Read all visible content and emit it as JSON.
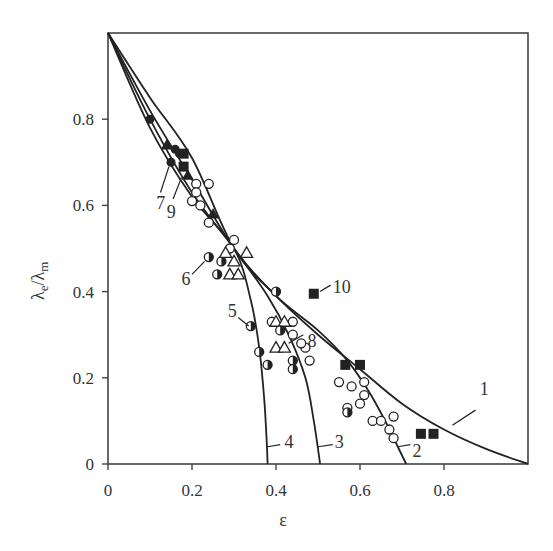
{
  "chart_data": {
    "type": "scatter",
    "title": "",
    "xlabel": "ε",
    "ylabel": "λe/λm",
    "ylabel_main": "λ",
    "ylabel_sub_e": "e",
    "ylabel_slash": "/λ",
    "ylabel_sub_m": "m",
    "xlim": [
      0,
      1.0
    ],
    "ylim": [
      0,
      1.0
    ],
    "xticks": [
      0,
      0.2,
      0.4,
      0.6,
      0.8
    ],
    "xtick_labels": [
      "0",
      "0.2",
      "0.4",
      "0.6",
      "0.8"
    ],
    "yticks": [
      0,
      0.2,
      0.4,
      0.6,
      0.8
    ],
    "ytick_labels": [
      "0",
      "0.2",
      "0.4",
      "0.6",
      "0.8"
    ],
    "grid": false,
    "legend": "none (curves and point sets numbered inline 1–10)",
    "curves": [
      {
        "name": "1",
        "points": [
          [
            0,
            1.0
          ],
          [
            0.1,
            0.85
          ],
          [
            0.2,
            0.71
          ],
          [
            0.3,
            0.5
          ],
          [
            0.4,
            0.39
          ],
          [
            0.5,
            0.3
          ],
          [
            0.6,
            0.22
          ],
          [
            0.7,
            0.14
          ],
          [
            0.8,
            0.08
          ],
          [
            0.9,
            0.035
          ],
          [
            1.0,
            0.0
          ]
        ]
      },
      {
        "name": "2",
        "points": [
          [
            0,
            1.0
          ],
          [
            0.1,
            0.82
          ],
          [
            0.2,
            0.66
          ],
          [
            0.3,
            0.5
          ],
          [
            0.4,
            0.39
          ],
          [
            0.5,
            0.31
          ],
          [
            0.57,
            0.24
          ],
          [
            0.62,
            0.17
          ],
          [
            0.66,
            0.1
          ],
          [
            0.69,
            0.04
          ],
          [
            0.71,
            0.0
          ]
        ]
      },
      {
        "name": "3",
        "points": [
          [
            0,
            1.0
          ],
          [
            0.1,
            0.8
          ],
          [
            0.2,
            0.63
          ],
          [
            0.3,
            0.5
          ],
          [
            0.38,
            0.39
          ],
          [
            0.43,
            0.3
          ],
          [
            0.47,
            0.2
          ],
          [
            0.49,
            0.1
          ],
          [
            0.505,
            0.0
          ]
        ]
      },
      {
        "name": "4",
        "points": [
          [
            0,
            1.0
          ],
          [
            0.1,
            0.78
          ],
          [
            0.2,
            0.62
          ],
          [
            0.3,
            0.5
          ],
          [
            0.34,
            0.38
          ],
          [
            0.36,
            0.27
          ],
          [
            0.372,
            0.15
          ],
          [
            0.378,
            0.05
          ],
          [
            0.38,
            0.0
          ]
        ]
      }
    ],
    "series": [
      {
        "name": "7",
        "marker": "filled-circle",
        "values": [
          [
            0.15,
            0.7
          ],
          [
            0.16,
            0.73
          ],
          [
            0.1,
            0.8
          ],
          [
            0.17,
            0.72
          ]
        ]
      },
      {
        "name": "9",
        "marker": "filled-triangle",
        "values": [
          [
            0.19,
            0.67
          ],
          [
            0.14,
            0.74
          ],
          [
            0.25,
            0.58
          ]
        ]
      },
      {
        "name": "open-circles",
        "marker": "open-circle",
        "values": [
          [
            0.21,
            0.65
          ],
          [
            0.24,
            0.65
          ],
          [
            0.21,
            0.63
          ],
          [
            0.2,
            0.61
          ],
          [
            0.22,
            0.6
          ],
          [
            0.24,
            0.56
          ],
          [
            0.3,
            0.52
          ],
          [
            0.29,
            0.5
          ],
          [
            0.39,
            0.33
          ],
          [
            0.44,
            0.33
          ],
          [
            0.44,
            0.3
          ],
          [
            0.47,
            0.27
          ],
          [
            0.48,
            0.24
          ],
          [
            0.55,
            0.19
          ],
          [
            0.58,
            0.18
          ],
          [
            0.61,
            0.16
          ],
          [
            0.57,
            0.13
          ],
          [
            0.6,
            0.14
          ],
          [
            0.63,
            0.1
          ],
          [
            0.65,
            0.1
          ],
          [
            0.67,
            0.08
          ],
          [
            0.68,
            0.11
          ],
          [
            0.68,
            0.06
          ],
          [
            0.61,
            0.19
          ]
        ]
      },
      {
        "name": "6",
        "marker": "half-filled-circle",
        "values": [
          [
            0.24,
            0.48
          ],
          [
            0.27,
            0.47
          ],
          [
            0.26,
            0.44
          ]
        ]
      },
      {
        "name": "triangles",
        "marker": "open-triangle",
        "values": [
          [
            0.28,
            0.49
          ],
          [
            0.33,
            0.49
          ],
          [
            0.3,
            0.47
          ],
          [
            0.29,
            0.44
          ],
          [
            0.31,
            0.44
          ],
          [
            0.4,
            0.33
          ],
          [
            0.42,
            0.33
          ],
          [
            0.4,
            0.27
          ],
          [
            0.42,
            0.27
          ]
        ]
      },
      {
        "name": "5",
        "marker": "half-filled-circle",
        "values": [
          [
            0.34,
            0.32
          ],
          [
            0.36,
            0.26
          ],
          [
            0.38,
            0.23
          ],
          [
            0.4,
            0.4
          ],
          [
            0.41,
            0.31
          ],
          [
            0.44,
            0.24
          ],
          [
            0.44,
            0.22
          ],
          [
            0.57,
            0.12
          ]
        ]
      },
      {
        "name": "8",
        "marker": "open-circle",
        "values": [
          [
            0.46,
            0.28
          ]
        ]
      },
      {
        "name": "10",
        "marker": "filled-square",
        "values": [
          [
            0.49,
            0.395
          ],
          [
            0.565,
            0.23
          ],
          [
            0.6,
            0.23
          ],
          [
            0.745,
            0.07
          ],
          [
            0.775,
            0.07
          ],
          [
            0.18,
            0.69
          ],
          [
            0.18,
            0.72
          ]
        ]
      }
    ],
    "annotations": [
      {
        "text": "1",
        "x": 0.885,
        "y": 0.175
      },
      {
        "text": "2",
        "x": 0.725,
        "y": 0.03
      },
      {
        "text": "3",
        "x": 0.54,
        "y": 0.05
      },
      {
        "text": "4",
        "x": 0.42,
        "y": 0.05
      },
      {
        "text": "5",
        "x": 0.285,
        "y": 0.355
      },
      {
        "text": "6",
        "x": 0.175,
        "y": 0.43
      },
      {
        "text": "7",
        "x": 0.115,
        "y": 0.605
      },
      {
        "text": "8",
        "x": 0.475,
        "y": 0.285
      },
      {
        "text": "9",
        "x": 0.14,
        "y": 0.585
      },
      {
        "text": "10",
        "x": 0.535,
        "y": 0.41
      }
    ]
  }
}
